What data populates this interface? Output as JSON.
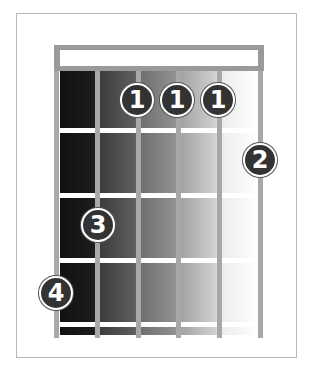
{
  "diagram": {
    "type": "chord-diagram",
    "instrument": "guitar",
    "strings": 6,
    "frets_shown": 4,
    "colors": {
      "frame_border": "#b8b8b8",
      "nut": "#9a9a9a",
      "string": "#a8a8a8",
      "fret": "#ffffff",
      "finger_fill": "#333333",
      "finger_text": "#ffffff",
      "shade_dark": "#111111",
      "shade_light": "#ffffff"
    },
    "fingers": [
      {
        "label": "1",
        "string": 3,
        "fret": 1
      },
      {
        "label": "1",
        "string": 4,
        "fret": 1
      },
      {
        "label": "1",
        "string": 5,
        "fret": 1
      },
      {
        "label": "2",
        "string": 6,
        "fret": 2
      },
      {
        "label": "3",
        "string": 2,
        "fret": 3
      },
      {
        "label": "4",
        "string": 1,
        "fret": 4
      }
    ]
  }
}
